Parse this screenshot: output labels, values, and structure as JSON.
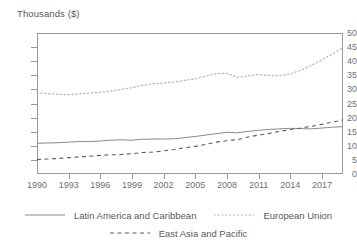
{
  "chart_data": {
    "type": "line",
    "title": "",
    "ylabel": "Thousands ($)",
    "xlabel": "",
    "ylim": [
      0,
      50
    ],
    "ytick_step": 5,
    "yticks": [
      "0",
      "5",
      "10",
      "15",
      "20",
      "25",
      "30",
      "35",
      "40",
      "45",
      "50"
    ],
    "xlim": [
      1990,
      2019
    ],
    "xticks": [
      "1990",
      "1993",
      "1996",
      "1999",
      "2002",
      "2005",
      "2008",
      "2011",
      "2014",
      "2017"
    ],
    "grid": false,
    "legend_position": "bottom",
    "x": [
      1990,
      1991,
      1992,
      1993,
      1994,
      1995,
      1996,
      1997,
      1998,
      1999,
      2000,
      2001,
      2002,
      2003,
      2004,
      2005,
      2006,
      2007,
      2008,
      2009,
      2010,
      2011,
      2012,
      2013,
      2014,
      2015,
      2016,
      2017,
      2018,
      2019
    ],
    "series": [
      {
        "name": "Latin America and Caribbean",
        "style": "solid",
        "color": "#8a8a8a",
        "values": [
          10.9,
          11.0,
          11.1,
          11.3,
          11.5,
          11.5,
          11.7,
          12.0,
          12.1,
          12.0,
          12.3,
          12.4,
          12.4,
          12.5,
          12.9,
          13.3,
          13.8,
          14.3,
          14.8,
          14.6,
          15.1,
          15.5,
          15.8,
          16.0,
          16.2,
          16.1,
          16.0,
          16.3,
          16.6,
          16.8
        ]
      },
      {
        "name": "European Union",
        "style": "dotted",
        "color": "#b8b8b8",
        "values": [
          28.9,
          28.5,
          28.3,
          28.1,
          28.4,
          28.7,
          29.0,
          29.4,
          30.0,
          30.6,
          31.5,
          32.0,
          32.3,
          32.6,
          33.2,
          33.8,
          34.7,
          35.6,
          35.7,
          34.3,
          34.8,
          35.3,
          34.9,
          34.9,
          35.5,
          36.8,
          38.5,
          40.5,
          42.6,
          44.8
        ]
      },
      {
        "name": "East Asia and Pacific",
        "style": "dashed",
        "color": "#5a5a5a",
        "values": [
          5.1,
          5.3,
          5.5,
          5.8,
          6.1,
          6.3,
          6.6,
          6.8,
          6.9,
          7.2,
          7.6,
          7.8,
          8.2,
          8.7,
          9.3,
          9.8,
          10.5,
          11.3,
          11.8,
          12.2,
          13.1,
          13.8,
          14.4,
          15.1,
          15.8,
          16.3,
          16.9,
          17.6,
          18.4,
          19.2
        ]
      }
    ]
  },
  "legend": {
    "items": [
      {
        "label": "Latin America and Caribbean",
        "style": "solid"
      },
      {
        "label": "European Union",
        "style": "dotted"
      },
      {
        "label": "East Asia and Pacific",
        "style": "dashed"
      }
    ]
  }
}
